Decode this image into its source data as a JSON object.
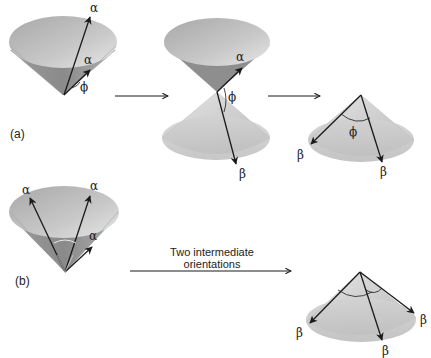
{
  "figure": {
    "panel_a": {
      "label": "(a)",
      "stage1": {
        "vectors": [
          "α",
          "α"
        ],
        "angle": "ϕ"
      },
      "stage2": {
        "vectors": [
          "α",
          "β"
        ],
        "angle": "ϕ"
      },
      "stage3": {
        "vectors": [
          "β",
          "β"
        ],
        "angle": "ϕ"
      }
    },
    "panel_b": {
      "label": "(b)",
      "stage1": {
        "vectors": [
          "α",
          "α",
          "α"
        ]
      },
      "transition_line1": "Two intermediate",
      "transition_line2": "orientations",
      "stage2": {
        "vectors": [
          "β",
          "β",
          "β"
        ]
      }
    }
  },
  "colors": {
    "cone_light": "#d8d8d8",
    "cone_mid": "#b5b5b5",
    "cone_dark": "#8e8e8e",
    "arrow": "#1a1a1a"
  }
}
